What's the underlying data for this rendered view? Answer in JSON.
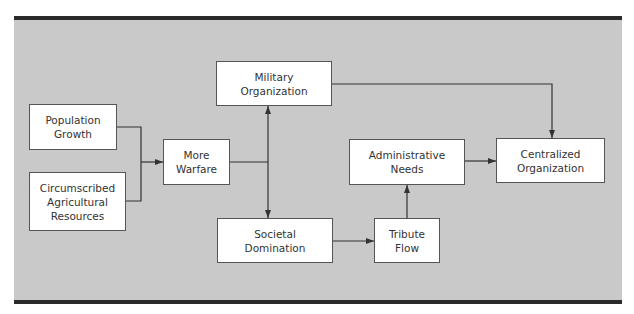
{
  "diagram": {
    "colors": {
      "background": "#c9c9c9",
      "border_bars": "#2a2a2a",
      "node_fill": "#ffffff",
      "edge": "#333333"
    },
    "nodes": {
      "population_growth": "Population\nGrowth",
      "circumscribed": "Circumscribed\nAgricultural\nResources",
      "more_warfare": "More\nWarfare",
      "military_org": "Military\nOrganization",
      "societal_domination": "Societal\nDomination",
      "tribute_flow": "Tribute\nFlow",
      "administrative_needs": "Administrative\nNeeds",
      "centralized_org": "Centralized\nOrganization"
    },
    "edges": [
      {
        "from": "Population Growth",
        "to": "More Warfare"
      },
      {
        "from": "Circumscribed Agricultural Resources",
        "to": "More Warfare"
      },
      {
        "from": "More Warfare",
        "to": "Military Organization"
      },
      {
        "from": "More Warfare",
        "to": "Societal Domination"
      },
      {
        "from": "Military Organization",
        "to": "Centralized Organization"
      },
      {
        "from": "Societal Domination",
        "to": "Tribute Flow"
      },
      {
        "from": "Tribute Flow",
        "to": "Administrative Needs"
      },
      {
        "from": "Administrative Needs",
        "to": "Centralized Organization"
      }
    ]
  }
}
